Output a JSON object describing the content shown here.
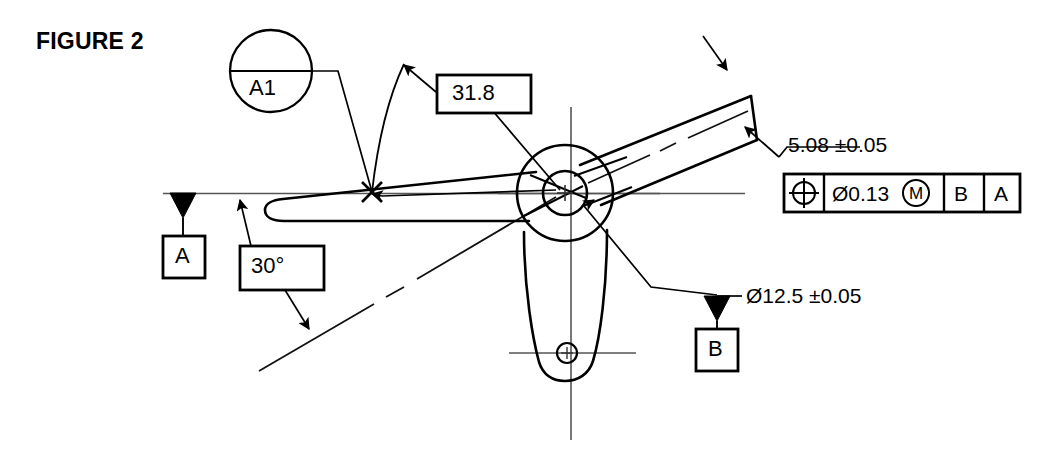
{
  "figure": {
    "title": "FIGURE 2"
  },
  "balloon": {
    "label": "A1",
    "name": "surface-callout-balloon"
  },
  "basic_dimensions": [
    {
      "id": "angle",
      "label": "30°"
    },
    {
      "id": "length",
      "label": "31.8"
    }
  ],
  "datums": [
    {
      "id": "a",
      "label": "A"
    },
    {
      "id": "b",
      "label": "B"
    }
  ],
  "dimensions": [
    {
      "id": "width",
      "label": "5.08 ±0.05"
    },
    {
      "id": "bore",
      "label": "Ø12.5 ±0.05"
    }
  ],
  "feature_control_frame": {
    "cells": [
      {
        "id": "symbol",
        "label": "⊕",
        "kind": "position-symbol"
      },
      {
        "id": "tolerance",
        "label": "Ø0.13",
        "modifier": "M",
        "kind": "tolerance-with-mmc"
      },
      {
        "id": "primary",
        "label": "B",
        "kind": "datum-ref"
      },
      {
        "id": "secondary",
        "label": "A",
        "kind": "datum-ref"
      }
    ]
  },
  "colors": {
    "line": "#000000",
    "centerline": "#555555",
    "background": "#ffffff"
  }
}
